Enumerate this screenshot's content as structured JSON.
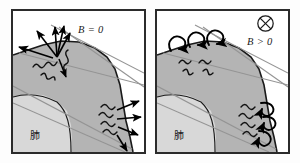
{
  "figure": {
    "name": "two-panel-plasma-boundary-diagram",
    "panels": [
      {
        "id": "left",
        "field_label": "B = 0",
        "organ_label": "肺",
        "field_symbol": null,
        "emission_style": "straight-arrows"
      },
      {
        "id": "right",
        "field_label": "B > 0",
        "organ_label": "肺",
        "field_symbol": "circled-cross",
        "emission_style": "curled-arrows"
      }
    ]
  },
  "colors": {
    "frame": "#2b2b2b",
    "background": "#ffffff",
    "body_fill": "#b4b4b4",
    "organ_fill": "#d8d8d8",
    "outline": "#1a1a1a",
    "ray_line": "#8c8c8c",
    "arrow": "#000000"
  }
}
